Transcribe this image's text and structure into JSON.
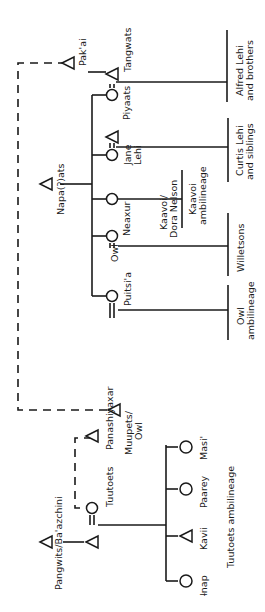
{
  "diagram": {
    "type": "kinship",
    "orientation": "rotated-90-ccw",
    "colors": {
      "ink": "#1a1a1a",
      "background": "#ffffff"
    },
    "upper_group": {
      "ancestors": {
        "napa_ats": "Napa(ʔ)ats",
        "pak_ai": "Pak'ai"
      },
      "people": {
        "tangwats": "Tangwats",
        "piyaats": "Piyaats",
        "jane_lehi_1": "Jane",
        "jane_lehi_2": "Lehi",
        "neaxur": "Neaxur",
        "owl_spouse": "Owl",
        "puitsia": "Puitsi'a",
        "muupets_1": "Muupets/",
        "muupets_2": "Owl",
        "kaavoi_1": "Kaavoi/",
        "kaavoi_2": "Dora Nelson"
      },
      "descendant_groups": {
        "alfred_1": "Alfred Lehi",
        "alfred_2": "and brothers",
        "curtis_1": "Curtis Lehi",
        "curtis_2": "and siblings",
        "kaavoi_amb_1": "Kaavoi",
        "kaavoi_amb_2": "ambilineage",
        "willetsons": "Willetsons",
        "owl_amb_1": "Owl",
        "owl_amb_2": "ambilineage"
      }
    },
    "lower_group": {
      "people": {
        "pangwits": "Pangwits/Ba'azchini",
        "tuutoets": "Tuutoets",
        "panashiyaxar": "Panashiyaxar",
        "enap": "Ɨnap",
        "kavii": "Kavii",
        "paarey": "Paarey",
        "masi": "Masi'"
      },
      "lineage_label": "Tuutoets ambilineage"
    }
  }
}
